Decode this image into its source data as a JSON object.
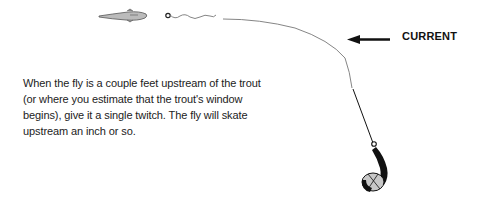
{
  "diagram": {
    "caption_lines": [
      "When the fly is a couple feet upstream of the trout",
      "(or where you estimate that the trout's window",
      "begins), give it a single twitch. The fly will skate",
      "upstream an inch or so."
    ],
    "current_label": "CURRENT",
    "elements": {
      "trout": "trout-icon",
      "fly": "fly-icon",
      "line": "fly-line",
      "rod": "fishing-rod",
      "angler": "angler-figure",
      "arrow": "current-arrow-left"
    },
    "colors": {
      "line": "#777777",
      "rod": "#111111",
      "fish_fill": "#bbbbbb",
      "angler_head": "#c8c8c8"
    }
  }
}
